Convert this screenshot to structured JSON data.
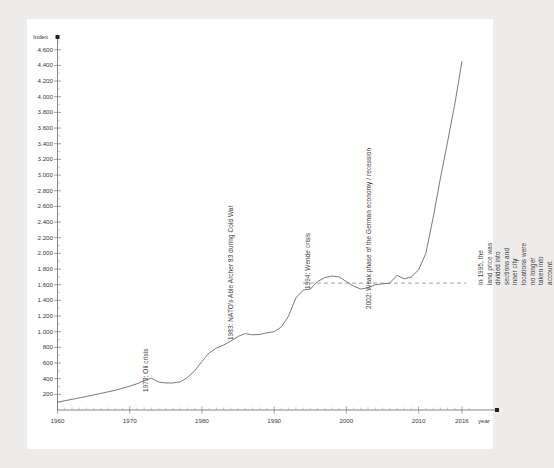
{
  "chart_data": {
    "type": "line",
    "title": "",
    "xlabel": "year",
    "ylabel": "Index",
    "xlim": [
      1960,
      2018.5
    ],
    "ylim": [
      0,
      4750
    ],
    "grid": false,
    "legend": null,
    "y_ticks": [
      "200",
      "400",
      "600",
      "800",
      "1.000",
      "1.200",
      "1.400",
      "1.600",
      "1.800",
      "2.000",
      "2.200",
      "2.400",
      "2.600",
      "2.800",
      "3.000",
      "3.200",
      "3.400",
      "3.600",
      "3.800",
      "4.000",
      "4.200",
      "4.400",
      "4.600"
    ],
    "y_tick_values": [
      200,
      400,
      600,
      800,
      1000,
      1200,
      1400,
      1600,
      1800,
      2000,
      2200,
      2400,
      2600,
      2800,
      3000,
      3200,
      3400,
      3600,
      3800,
      4000,
      4200,
      4400,
      4600
    ],
    "x_ticks": [
      "1960",
      "1970",
      "1980",
      "1990",
      "2000",
      "2010",
      "2016"
    ],
    "x_tick_values": [
      1960,
      1970,
      1980,
      1990,
      2000,
      2010,
      2016
    ],
    "reference_line": {
      "label": "",
      "value": 1620,
      "style": "dashed",
      "x_start": 1994,
      "x_end": 2016.6
    },
    "series": [
      {
        "name": "Land price index",
        "x": [
          1960,
          1961,
          1962,
          1963,
          1964,
          1965,
          1966,
          1967,
          1968,
          1969,
          1970,
          1971,
          1972,
          1973,
          1974,
          1975,
          1976,
          1977,
          1978,
          1979,
          1980,
          1981,
          1982,
          1983,
          1984,
          1985,
          1986,
          1987,
          1988,
          1989,
          1990,
          1991,
          1992,
          1993,
          1994,
          1995,
          1996,
          1997,
          1998,
          1999,
          2000,
          2001,
          2002,
          2003,
          2004,
          2005,
          2006,
          2007,
          2008,
          2009,
          2010,
          2011,
          2012,
          2013,
          2014,
          2015,
          2016
        ],
        "values": [
          100,
          118,
          136,
          155,
          173,
          192,
          212,
          232,
          252,
          278,
          305,
          335,
          375,
          405,
          358,
          345,
          345,
          360,
          415,
          500,
          620,
          730,
          790,
          830,
          880,
          940,
          975,
          960,
          965,
          985,
          1000,
          1060,
          1200,
          1430,
          1530,
          1545,
          1640,
          1690,
          1710,
          1700,
          1640,
          1580,
          1545,
          1560,
          1600,
          1610,
          1620,
          1720,
          1675,
          1640,
          1680,
          1720,
          1790,
          1870,
          1950,
          1965,
          2000
        ]
      }
    ],
    "annotations": [
      {
        "id": "oil-crisis",
        "text": "1973: Oil crisis",
        "x": 1973,
        "rotation": -90
      },
      {
        "id": "able-archer",
        "text": "1983: NATO's Able Archer 83 during Cold War",
        "x": 1983,
        "rotation": -90
      },
      {
        "id": "wende-crisis",
        "text": "1994: Wende crisis",
        "x": 1994,
        "rotation": -90
      },
      {
        "id": "german-economy",
        "text": "2002: Weak phase of the German economy / recession",
        "x": 2002,
        "rotation": -90
      },
      {
        "id": "land-price-note",
        "text": "In 1995, the land price was divided into sections and inner city locations were no longer taken into account.",
        "x": 2017,
        "rotation": -90,
        "lines": [
          "In 1995, the land price was divided into sections and inner city",
          "locations were no longer taken into account."
        ]
      }
    ],
    "note_after_2008": "Index continues steeply upward from 2009 to 2016 reaching about 4.450"
  }
}
